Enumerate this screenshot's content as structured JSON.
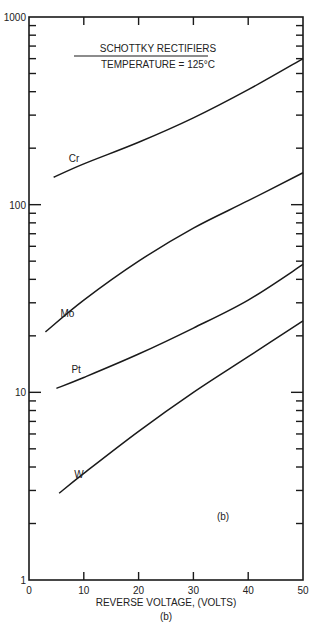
{
  "chart_data": {
    "type": "line",
    "title": "SCHOTTKY RECTIFIERS",
    "subtitle": "TEMPERATURE = 125°C",
    "xlabel": "REVERSE VOLTAGE, (VOLTS)",
    "ylabel": "",
    "caption": "(b)",
    "inner_label": "(b)",
    "xlim": [
      0,
      50
    ],
    "ylim": [
      1,
      1000
    ],
    "yscale": "log",
    "x_ticks": [
      "0",
      "10",
      "20",
      "30",
      "40",
      "50"
    ],
    "y_ticks": [
      "1",
      "10",
      "100",
      "1000"
    ],
    "grid": false,
    "series": [
      {
        "name": "Cr",
        "x": [
          4.5,
          10,
          20,
          30,
          40,
          50
        ],
        "values": [
          140,
          165,
          215,
          290,
          410,
          600
        ]
      },
      {
        "name": "Mo",
        "x": [
          3,
          10,
          20,
          30,
          40,
          50
        ],
        "values": [
          21,
          31,
          50,
          75,
          105,
          148
        ]
      },
      {
        "name": "Pt",
        "x": [
          5,
          10,
          20,
          30,
          40,
          50
        ],
        "values": [
          10.5,
          12,
          16,
          22,
          31,
          48
        ]
      },
      {
        "name": "W",
        "x": [
          5.5,
          10,
          20,
          30,
          40,
          50
        ],
        "values": [
          2.9,
          3.7,
          6.2,
          10,
          15.5,
          24
        ]
      }
    ]
  }
}
